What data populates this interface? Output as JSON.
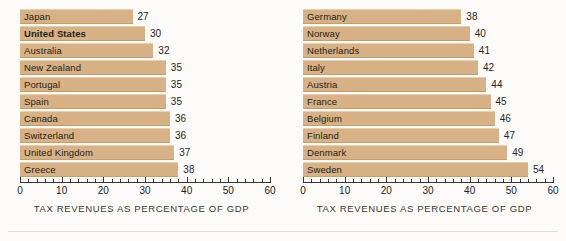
{
  "chart_data": [
    {
      "type": "bar",
      "orientation": "horizontal",
      "panel": "left",
      "title": "",
      "xlabel": "TAX REVENUES AS PERCENTAGE OF GDP",
      "ylabel": "",
      "xlim": [
        0,
        60
      ],
      "xticks": [
        0,
        10,
        20,
        30,
        40,
        50,
        60
      ],
      "xtick_labels": [
        "0",
        "10",
        "20",
        "30",
        "40",
        "50",
        "60"
      ],
      "minor_tick_step": 2,
      "grid": false,
      "legend": null,
      "bar_color": "#d8b184",
      "categories": [
        "Japan",
        "United States",
        "Australia",
        "New Zealand",
        "Portugal",
        "Spain",
        "Canada",
        "Switzerland",
        "United Kingdom",
        "Greece"
      ],
      "values": [
        27,
        30,
        32,
        35,
        35,
        35,
        36,
        36,
        37,
        38
      ],
      "emphasized": [
        "United States"
      ]
    },
    {
      "type": "bar",
      "orientation": "horizontal",
      "panel": "right",
      "title": "",
      "xlabel": "TAX REVENUES AS PERCENTAGE OF GDP",
      "ylabel": "",
      "xlim": [
        0,
        60
      ],
      "xticks": [
        0,
        10,
        20,
        30,
        40,
        50,
        60
      ],
      "xtick_labels": [
        "0",
        "10",
        "20",
        "30",
        "40",
        "50",
        "60"
      ],
      "minor_tick_step": 2,
      "grid": false,
      "legend": null,
      "bar_color": "#d8b184",
      "categories": [
        "Germany",
        "Norway",
        "Netherlands",
        "Italy",
        "Austria",
        "France",
        "Belgium",
        "Finland",
        "Denmark",
        "Sweden"
      ],
      "values": [
        38,
        40,
        41,
        42,
        44,
        45,
        46,
        47,
        49,
        54
      ],
      "emphasized": []
    }
  ]
}
